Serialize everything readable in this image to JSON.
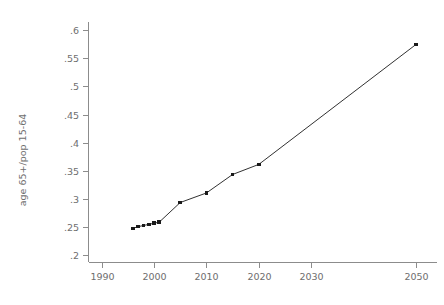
{
  "chart_data": {
    "type": "line",
    "title": "",
    "subtitle": "",
    "xlabel": "",
    "ylabel": "age 65+/pop 15-64",
    "xlim": [
      1987.5,
      2054
    ],
    "ylim": [
      0.186,
      0.615
    ],
    "grid": false,
    "legend": null,
    "marker": "square",
    "line_color": "#1a1a1a",
    "axis_color": "#8c8c8c",
    "text_color": "#6e6e6e",
    "background": "#ffffff",
    "xticks": [
      1990,
      2000,
      2010,
      2020,
      2030,
      2050
    ],
    "xticklabels": [
      "1990",
      "2000",
      "2010",
      "2020",
      "2030",
      "2050"
    ],
    "yticks": [
      0.2,
      0.25,
      0.3,
      0.35,
      0.4,
      0.45,
      0.5,
      0.55,
      0.6
    ],
    "yticklabels": [
      ".2",
      ".25",
      ".3",
      ".35",
      ".4",
      ".45",
      ".5",
      ".55",
      ".6"
    ],
    "x": [
      1996,
      1997,
      1998,
      1999,
      2000,
      2001,
      2005,
      2010,
      2015,
      2020,
      2050
    ],
    "values": [
      0.247,
      0.25,
      0.252,
      0.254,
      0.256,
      0.258,
      0.293,
      0.31,
      0.343,
      0.361,
      0.575
    ],
    "series": [
      {
        "name": "age 65+/pop 15-64",
        "x": [
          1996,
          1997,
          1998,
          1999,
          2000,
          2001,
          2005,
          2010,
          2015,
          2020,
          2050
        ],
        "values": [
          0.247,
          0.25,
          0.252,
          0.254,
          0.256,
          0.258,
          0.293,
          0.31,
          0.343,
          0.361,
          0.575
        ]
      }
    ],
    "annotations": []
  }
}
